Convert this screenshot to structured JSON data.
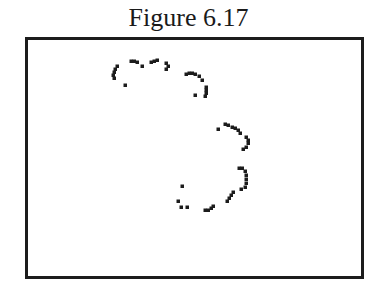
{
  "figure": {
    "title": "Figure 6.17"
  },
  "colors": {
    "ink": "#1c1c1c",
    "background": "#ffffff"
  },
  "chart_data": {
    "type": "scatter",
    "title": "Figure 6.17",
    "xlabel": "",
    "ylabel": "",
    "grid": false,
    "legend": null,
    "points_px": [
      [
        117,
        66
      ],
      [
        115,
        69
      ],
      [
        114,
        72
      ],
      [
        113,
        75
      ],
      [
        114,
        78
      ],
      [
        125,
        85
      ],
      [
        131,
        61
      ],
      [
        134,
        61
      ],
      [
        137,
        62
      ],
      [
        142,
        66
      ],
      [
        151,
        62
      ],
      [
        154,
        61
      ],
      [
        157,
        60
      ],
      [
        166,
        63
      ],
      [
        168,
        66
      ],
      [
        166,
        69
      ],
      [
        186,
        74
      ],
      [
        189,
        73
      ],
      [
        192,
        73
      ],
      [
        195,
        74
      ],
      [
        199,
        76
      ],
      [
        202,
        80
      ],
      [
        195,
        95
      ],
      [
        206,
        87
      ],
      [
        206,
        90
      ],
      [
        206,
        93
      ],
      [
        205,
        96
      ],
      [
        218,
        129
      ],
      [
        225,
        124
      ],
      [
        228,
        125
      ],
      [
        232,
        127
      ],
      [
        235,
        128
      ],
      [
        238,
        130
      ],
      [
        240,
        133
      ],
      [
        246,
        137
      ],
      [
        248,
        140
      ],
      [
        248,
        143
      ],
      [
        246,
        147
      ],
      [
        243,
        149
      ],
      [
        239,
        168
      ],
      [
        242,
        168
      ],
      [
        245,
        171
      ],
      [
        246,
        175
      ],
      [
        246,
        179
      ],
      [
        246,
        183
      ],
      [
        245,
        187
      ],
      [
        241,
        189
      ],
      [
        233,
        192
      ],
      [
        231,
        195
      ],
      [
        229,
        198
      ],
      [
        227,
        201
      ],
      [
        182,
        186
      ],
      [
        178,
        201
      ],
      [
        181,
        207
      ],
      [
        187,
        207
      ],
      [
        205,
        210
      ],
      [
        208,
        210
      ],
      [
        211,
        208
      ],
      [
        213,
        206
      ]
    ]
  }
}
